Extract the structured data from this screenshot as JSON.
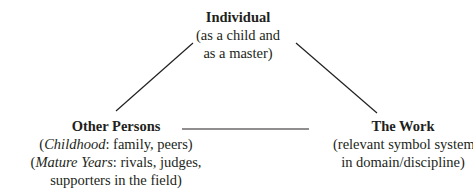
{
  "diagram": {
    "type": "triangle",
    "nodes": {
      "individual": {
        "title": "Individual",
        "lines": [
          "(as a child and",
          "as a master)"
        ]
      },
      "other_persons": {
        "title": "Other Persons",
        "line1": {
          "open": "(",
          "italic": "Childhood",
          "rest": ": family, peers)"
        },
        "line2": {
          "open": "(",
          "italic": "Mature Years",
          "rest": ": rivals, judges,"
        },
        "line3": "supporters in the field)"
      },
      "the_work": {
        "title": "The Work",
        "lines": [
          "(relevant symbol systems",
          "in domain/discipline)"
        ]
      }
    },
    "edges": [
      {
        "from": "individual",
        "to": "other_persons"
      },
      {
        "from": "individual",
        "to": "the_work"
      },
      {
        "from": "other_persons",
        "to": "the_work"
      }
    ],
    "line_color": "#231f20"
  }
}
